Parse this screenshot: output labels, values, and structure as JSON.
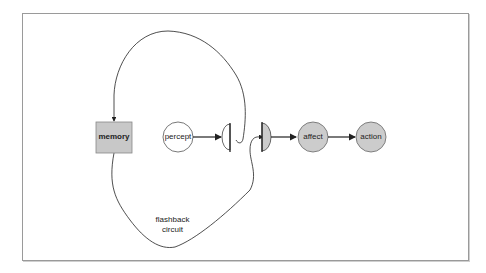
{
  "diagram": {
    "nodes": {
      "memory": {
        "label": "memory",
        "shape": "rectangle",
        "fill": "#c8c8c8"
      },
      "percept": {
        "label": "percept",
        "shape": "circle",
        "fill": "#ffffff"
      },
      "gate1": {
        "label": "",
        "shape": "half-circle-gate",
        "fill": "#ffffff"
      },
      "gate2": {
        "label": "",
        "shape": "half-circle-gate",
        "fill": "#cccccc"
      },
      "affect": {
        "label": "affect",
        "shape": "circle",
        "fill": "#cccccc"
      },
      "action": {
        "label": "action",
        "shape": "circle",
        "fill": "#cccccc"
      }
    },
    "edges": [
      {
        "from": "percept",
        "to": "gate1"
      },
      {
        "from": "gate2",
        "to": "affect"
      },
      {
        "from": "affect",
        "to": "action"
      },
      {
        "from": "gate1",
        "to": "memory",
        "route": "upper loop"
      },
      {
        "from": "memory",
        "to": "gate2",
        "route": "lower loop"
      }
    ],
    "loop_label_line1": "flashback",
    "loop_label_line2": "circuit",
    "stroke_color": "#222222"
  }
}
